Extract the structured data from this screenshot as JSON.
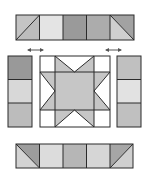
{
  "diagram": {
    "colors": {
      "outline": "#2b2b2b",
      "white": "#ffffff",
      "lightest": "#e6e6e6",
      "light": "#d4d4d4",
      "medium": "#bdbdbd",
      "medium_dark": "#a8a8a8",
      "dark": "#939393",
      "star": "#c2c2c2",
      "arrow": "#555555"
    },
    "top_strip": {
      "squares": [
        {
          "type": "hst",
          "diagonal": "bl-tr",
          "fill_a": "#c4c4c4",
          "fill_b": "#bcbcbc"
        },
        {
          "type": "solid",
          "fill": "#e4e4e4"
        },
        {
          "type": "solid",
          "fill": "#9a9a9a"
        },
        {
          "type": "solid",
          "fill": "#acacac"
        },
        {
          "type": "hst",
          "diagonal": "tl-br",
          "fill_a": "#a2a2a2",
          "fill_b": "#cfcfcf"
        }
      ]
    },
    "left_column": {
      "squares": [
        {
          "fill": "#999999"
        },
        {
          "fill": "#d8d8d8"
        },
        {
          "fill": "#bcbcbc"
        }
      ]
    },
    "right_column": {
      "squares": [
        {
          "fill": "#c0c0c0"
        },
        {
          "fill": "#e2e2e2"
        },
        {
          "fill": "#c0c0c0"
        }
      ]
    },
    "center_block": {
      "type": "sawtooth-star",
      "star_fill": "#c6c6c6",
      "background": "#ffffff"
    },
    "bottom_strip": {
      "squares": [
        {
          "type": "hst",
          "diagonal": "tl-br",
          "fill_a": "#9d9d9d",
          "fill_b": "#d3d3d3"
        },
        {
          "type": "solid",
          "fill": "#dcdcdc"
        },
        {
          "type": "solid",
          "fill": "#b6b6b6"
        },
        {
          "type": "solid",
          "fill": "#d6d6d6"
        },
        {
          "type": "hst",
          "diagonal": "bl-tr",
          "fill_a": "#cfcfcf",
          "fill_b": "#a6a6a6"
        }
      ]
    },
    "arrows": [
      {
        "name": "left-insert-arrow",
        "direction": "double-horizontal"
      },
      {
        "name": "right-insert-arrow",
        "direction": "double-horizontal"
      }
    ]
  }
}
